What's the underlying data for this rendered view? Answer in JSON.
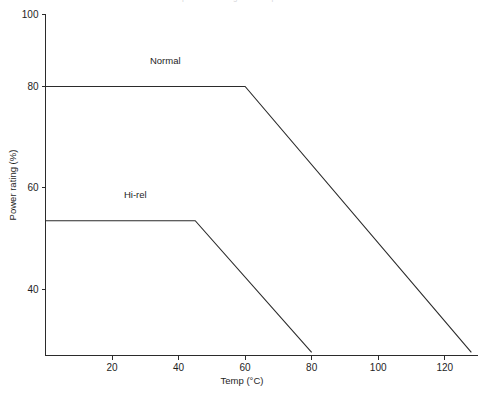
{
  "figure": {
    "faint_cut_title": "power derating with temperature",
    "background_color": "#ffffff",
    "line_color": "#2b2b2b",
    "text_color": "#1e1e1e"
  },
  "chart_data": {
    "type": "line",
    "title": "",
    "xlabel": "Temp (°C)",
    "ylabel": "Power rating (%)",
    "xlim": [
      0,
      130
    ],
    "ylim": [
      27,
      100
    ],
    "xticks": [
      20,
      40,
      60,
      80,
      100,
      120
    ],
    "yticks": [
      40,
      60,
      80,
      100
    ],
    "xtick_labels": [
      "20",
      "40",
      "60",
      "80",
      "100",
      "120"
    ],
    "ytick_labels": [
      "40",
      "60",
      "80",
      "100"
    ],
    "grid": false,
    "legend": "inline-labels",
    "series": [
      {
        "name": "Normal",
        "label": "Normal",
        "label_x": 36,
        "label_y": 84.5,
        "x": [
          0,
          60,
          128
        ],
        "y": [
          80,
          80,
          27.5
        ]
      },
      {
        "name": "Hi-rel",
        "label": "Hi-rel",
        "label_x": 27,
        "label_y": 58,
        "x": [
          0,
          45,
          80
        ],
        "y": [
          53.5,
          53.5,
          27.5
        ]
      }
    ]
  }
}
